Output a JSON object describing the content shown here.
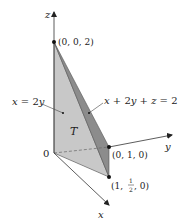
{
  "diagram": {
    "type": "3d-solid-region",
    "colors": {
      "background": "#ffffff",
      "axis": "#333333",
      "face_back": "#c8c8c8",
      "face_front_plane": "#8c8c8c",
      "face_bottom": "#bdbdbd",
      "edge": "#555555",
      "point": "#111111",
      "text": "#222222"
    },
    "axes": {
      "x": {
        "label": "x"
      },
      "y": {
        "label": "y"
      },
      "z": {
        "label": "z"
      }
    },
    "origin": {
      "label": "0"
    },
    "points": [
      {
        "id": "p002",
        "label": "(0, 0, 2)"
      },
      {
        "id": "p010",
        "label_open": "(0, 1, 0)"
      },
      {
        "id": "p1half0",
        "label_prefix": "(1, ",
        "frac_num": "1",
        "frac_den": "2",
        "label_suffix": ", 0)"
      }
    ],
    "region_label": "T",
    "plane_labels": {
      "left": {
        "var1": "x",
        "eq": " = 2",
        "var2": "y"
      },
      "right": {
        "var1": "x",
        "op1": " + 2",
        "var2": "y",
        "op2": " + ",
        "var3": "z",
        "eq": " = 2"
      }
    }
  }
}
